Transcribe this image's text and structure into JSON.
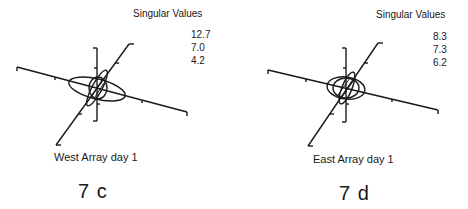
{
  "panels": [
    {
      "id": "7c",
      "singular_values_title": "Singular Values",
      "singular_values": [
        "12.7",
        "7.0",
        "4.2"
      ],
      "caption": "West Array day 1",
      "figure_label": "7 c"
    },
    {
      "id": "7d",
      "singular_values_title": "Singular Values",
      "singular_values": [
        "8.3",
        "7.3",
        "6.2"
      ],
      "caption": "East Array day 1",
      "figure_label": "7 d"
    }
  ],
  "colors": {
    "ink": "#1a1a1a",
    "background": "#ffffff"
  }
}
